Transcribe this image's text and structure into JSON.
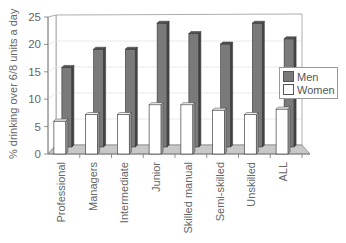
{
  "chart_data": {
    "type": "bar",
    "title": "",
    "xlabel": "",
    "ylabel": "% drinking over 6/8 units a day",
    "ylim": [
      0,
      25
    ],
    "yticks": [
      0,
      5,
      10,
      15,
      20,
      25
    ],
    "grid": true,
    "legend_position": "right",
    "style": "3d-clustered-bar",
    "categories": [
      "Professional",
      "Managers",
      "Intermediate",
      "Junior",
      "Skilled manual",
      "Semi-skilled",
      "Unskilled",
      "ALL"
    ],
    "series": [
      {
        "name": "Men",
        "color": "#7a7a7a",
        "values": [
          15.5,
          19,
          19,
          24,
          22,
          20,
          24,
          21
        ]
      },
      {
        "name": "Women",
        "color": "#ffffff",
        "values": [
          6,
          7.2,
          7.2,
          9,
          9,
          8,
          7.2,
          8.2
        ]
      }
    ]
  },
  "legend": {
    "items": [
      {
        "label": "Men",
        "color": "#7a7a7a"
      },
      {
        "label": "Women",
        "color": "#ffffff"
      }
    ]
  }
}
